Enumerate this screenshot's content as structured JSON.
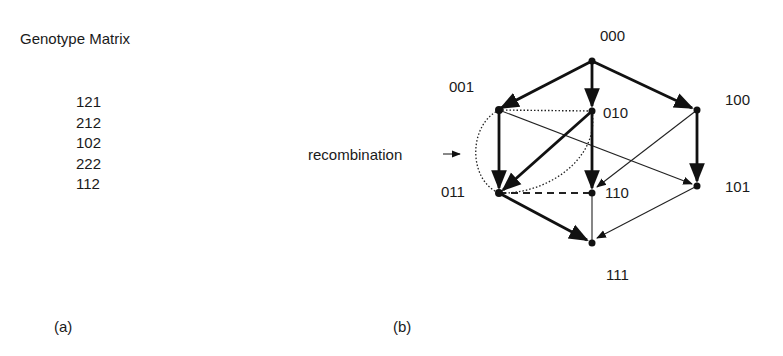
{
  "panel_a": {
    "title": "Genotype Matrix",
    "rows": [
      "121",
      "212",
      "102",
      "222",
      "112"
    ],
    "caption": "(a)"
  },
  "panel_b": {
    "caption": "(b)",
    "annotation": "recombination",
    "nodes": [
      {
        "id": "000",
        "label": "000"
      },
      {
        "id": "001",
        "label": "001"
      },
      {
        "id": "010",
        "label": "010"
      },
      {
        "id": "100",
        "label": "100"
      },
      {
        "id": "011",
        "label": "011"
      },
      {
        "id": "110",
        "label": "110"
      },
      {
        "id": "101",
        "label": "101"
      },
      {
        "id": "111",
        "label": "111"
      }
    ],
    "edges": [
      {
        "from": "000",
        "to": "001",
        "style": "thick-arrow"
      },
      {
        "from": "000",
        "to": "010",
        "style": "thick-arrow"
      },
      {
        "from": "000",
        "to": "100",
        "style": "thick-arrow"
      },
      {
        "from": "001",
        "to": "011",
        "style": "thick-arrow"
      },
      {
        "from": "010",
        "to": "011",
        "style": "thick-arrow"
      },
      {
        "from": "010",
        "to": "110",
        "style": "thick-arrow"
      },
      {
        "from": "100",
        "to": "101",
        "style": "thick-arrow"
      },
      {
        "from": "011",
        "to": "111",
        "style": "thick-arrow"
      },
      {
        "from": "001",
        "to": "101",
        "style": "thin-arrow"
      },
      {
        "from": "100",
        "to": "110",
        "style": "thin-arrow"
      },
      {
        "from": "101",
        "to": "111",
        "style": "thin-arrow"
      },
      {
        "from": "110",
        "to": "111",
        "style": "thin-line"
      },
      {
        "from": "001",
        "to": "010",
        "style": "dotted"
      },
      {
        "from": "011",
        "to": "110",
        "style": "dashed"
      },
      {
        "from": "001",
        "to": "011",
        "style": "dotted-arc"
      },
      {
        "from": "010",
        "to": "011",
        "style": "dotted-arc"
      }
    ]
  }
}
